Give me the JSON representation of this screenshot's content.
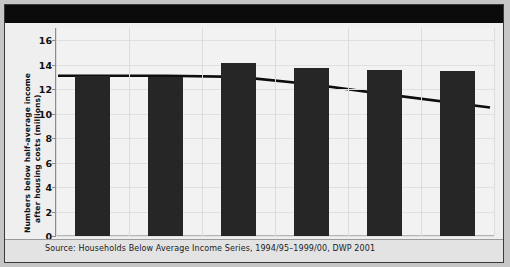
{
  "chart_data": {
    "type": "bar",
    "title": "",
    "xlabel": "",
    "ylabel": "Numbers below half-average income after housing costs (millions)",
    "ylabel_line1": "Numbers below half-average income",
    "ylabel_line2": "after housing costs (millions)",
    "categories": [
      "1994/95",
      "1995/96",
      "1996/97",
      "1997/98",
      "1998/99",
      "1999/00"
    ],
    "ylim": [
      0,
      17
    ],
    "yticks": [
      0,
      2,
      4,
      6,
      8,
      10,
      12,
      14,
      16
    ],
    "grid": true,
    "legend_position": "top",
    "series": [
      {
        "name": "Below 60% current year median",
        "type": "bar",
        "color": "#262626",
        "values": [
          13.1,
          13.0,
          14.1,
          13.7,
          13.6,
          13.5
        ]
      },
      {
        "name": "Below 60% 1994/95 median",
        "type": "line",
        "color": "#0d0d0d",
        "values": [
          13.1,
          13.1,
          13.0,
          12.4,
          11.6,
          10.5
        ]
      }
    ],
    "source": "Source: Households Below Average Income Series, 1994/95–1999/00, DWP 2001"
  },
  "legend": {
    "bar_label": "Below 60% current year median",
    "line_label": "Below 60% 1994/95 median"
  }
}
